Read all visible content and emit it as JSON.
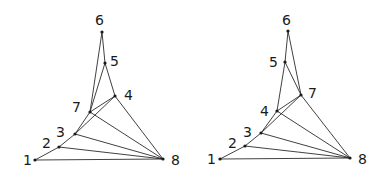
{
  "graphs": [
    {
      "name": "left-graph",
      "nodes": [
        {
          "id": "1",
          "x": 35,
          "y": 160,
          "lx": 23,
          "ly": 165
        },
        {
          "id": "2",
          "x": 59,
          "y": 147,
          "lx": 42,
          "ly": 148
        },
        {
          "id": "3",
          "x": 75,
          "y": 134,
          "lx": 56,
          "ly": 137
        },
        {
          "id": "4",
          "x": 115,
          "y": 96,
          "lx": 124,
          "ly": 100
        },
        {
          "id": "5",
          "x": 105,
          "y": 63,
          "lx": 110,
          "ly": 66
        },
        {
          "id": "6",
          "x": 102,
          "y": 32,
          "lx": 95,
          "ly": 25
        },
        {
          "id": "7",
          "x": 90,
          "y": 112,
          "lx": 72,
          "ly": 112
        },
        {
          "id": "8",
          "x": 163,
          "y": 159,
          "lx": 171,
          "ly": 165
        }
      ],
      "edges": [
        [
          "1",
          "2"
        ],
        [
          "2",
          "3"
        ],
        [
          "3",
          "7"
        ],
        [
          "3",
          "4"
        ],
        [
          "7",
          "6"
        ],
        [
          "7",
          "5"
        ],
        [
          "6",
          "5"
        ],
        [
          "5",
          "4"
        ],
        [
          "7",
          "4"
        ],
        [
          "4",
          "8"
        ],
        [
          "7",
          "8"
        ],
        [
          "3",
          "8"
        ],
        [
          "2",
          "8"
        ],
        [
          "1",
          "8"
        ]
      ]
    },
    {
      "name": "right-graph",
      "nodes": [
        {
          "id": "1",
          "x": 220,
          "y": 159,
          "lx": 207,
          "ly": 164
        },
        {
          "id": "2",
          "x": 245,
          "y": 146,
          "lx": 228,
          "ly": 148
        },
        {
          "id": "3",
          "x": 261,
          "y": 133,
          "lx": 243,
          "ly": 137
        },
        {
          "id": "4",
          "x": 277,
          "y": 111,
          "lx": 260,
          "ly": 116
        },
        {
          "id": "5",
          "x": 285,
          "y": 62,
          "lx": 269,
          "ly": 67
        },
        {
          "id": "6",
          "x": 288,
          "y": 31,
          "lx": 282,
          "ly": 25
        },
        {
          "id": "7",
          "x": 301,
          "y": 95,
          "lx": 308,
          "ly": 98
        },
        {
          "id": "8",
          "x": 350,
          "y": 158,
          "lx": 358,
          "ly": 164
        }
      ],
      "edges": [
        [
          "1",
          "2"
        ],
        [
          "2",
          "3"
        ],
        [
          "3",
          "4"
        ],
        [
          "3",
          "7"
        ],
        [
          "4",
          "5"
        ],
        [
          "5",
          "6"
        ],
        [
          "6",
          "7"
        ],
        [
          "5",
          "7"
        ],
        [
          "4",
          "7"
        ],
        [
          "7",
          "8"
        ],
        [
          "4",
          "8"
        ],
        [
          "3",
          "8"
        ],
        [
          "2",
          "8"
        ],
        [
          "1",
          "8"
        ]
      ]
    }
  ]
}
